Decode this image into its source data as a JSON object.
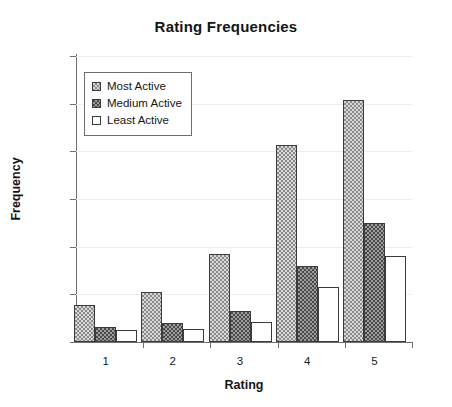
{
  "chart_data": {
    "type": "bar",
    "title": "Rating Frequencies",
    "xlabel": "Rating",
    "ylabel": "Frequency",
    "categories": [
      "1",
      "2",
      "3",
      "4",
      "5"
    ],
    "ylim": [
      0,
      120
    ],
    "yticks": [
      "0",
      "20",
      "40",
      "60",
      "80",
      "100",
      "120"
    ],
    "grid": true,
    "legend_position": "upper-left-inside",
    "series": [
      {
        "name": "Most Active",
        "values": [
          15.5,
          21,
          37,
          82.5,
          101.5
        ],
        "color": "#d8d8d8",
        "pattern": "light-checker"
      },
      {
        "name": "Medium Active",
        "values": [
          6.5,
          8,
          13,
          32,
          50
        ],
        "color": "#4a4a4a",
        "pattern": "dark-checker"
      },
      {
        "name": "Least Active",
        "values": [
          5,
          5.5,
          8.5,
          23,
          36
        ],
        "color": "#ffffff",
        "pattern": "solid-white"
      }
    ]
  }
}
